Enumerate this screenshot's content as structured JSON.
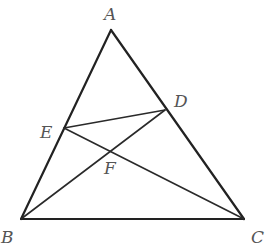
{
  "diagram": {
    "type": "triangle-with-cevians",
    "points": {
      "A": {
        "x": 111,
        "y": 30,
        "label": "A",
        "lx": 106,
        "ly": 20
      },
      "B": {
        "x": 21,
        "y": 219,
        "label": "B",
        "lx": 2,
        "ly": 243
      },
      "C": {
        "x": 244,
        "y": 219,
        "label": "C",
        "lx": 251,
        "ly": 243
      },
      "D": {
        "x": 165,
        "y": 110,
        "label": "D",
        "lx": 175,
        "ly": 107
      },
      "E": {
        "x": 64,
        "y": 128,
        "label": "E",
        "lx": 40,
        "ly": 137
      },
      "F": {
        "x": 110,
        "y": 152,
        "label": "F",
        "lx": 104,
        "ly": 174
      }
    },
    "segments": [
      {
        "from": "A",
        "to": "B",
        "weight": "thick"
      },
      {
        "from": "A",
        "to": "C",
        "weight": "thick"
      },
      {
        "from": "B",
        "to": "C",
        "weight": "thick"
      },
      {
        "from": "E",
        "to": "D",
        "weight": "thin"
      },
      {
        "from": "E",
        "to": "C",
        "weight": "thin"
      },
      {
        "from": "B",
        "to": "D",
        "weight": "thin"
      }
    ],
    "intersection": {
      "point": "F",
      "of": [
        "EC",
        "BD"
      ]
    },
    "colors": {
      "stroke": "#222222",
      "label": "#555555",
      "background": "#ffffff"
    }
  }
}
